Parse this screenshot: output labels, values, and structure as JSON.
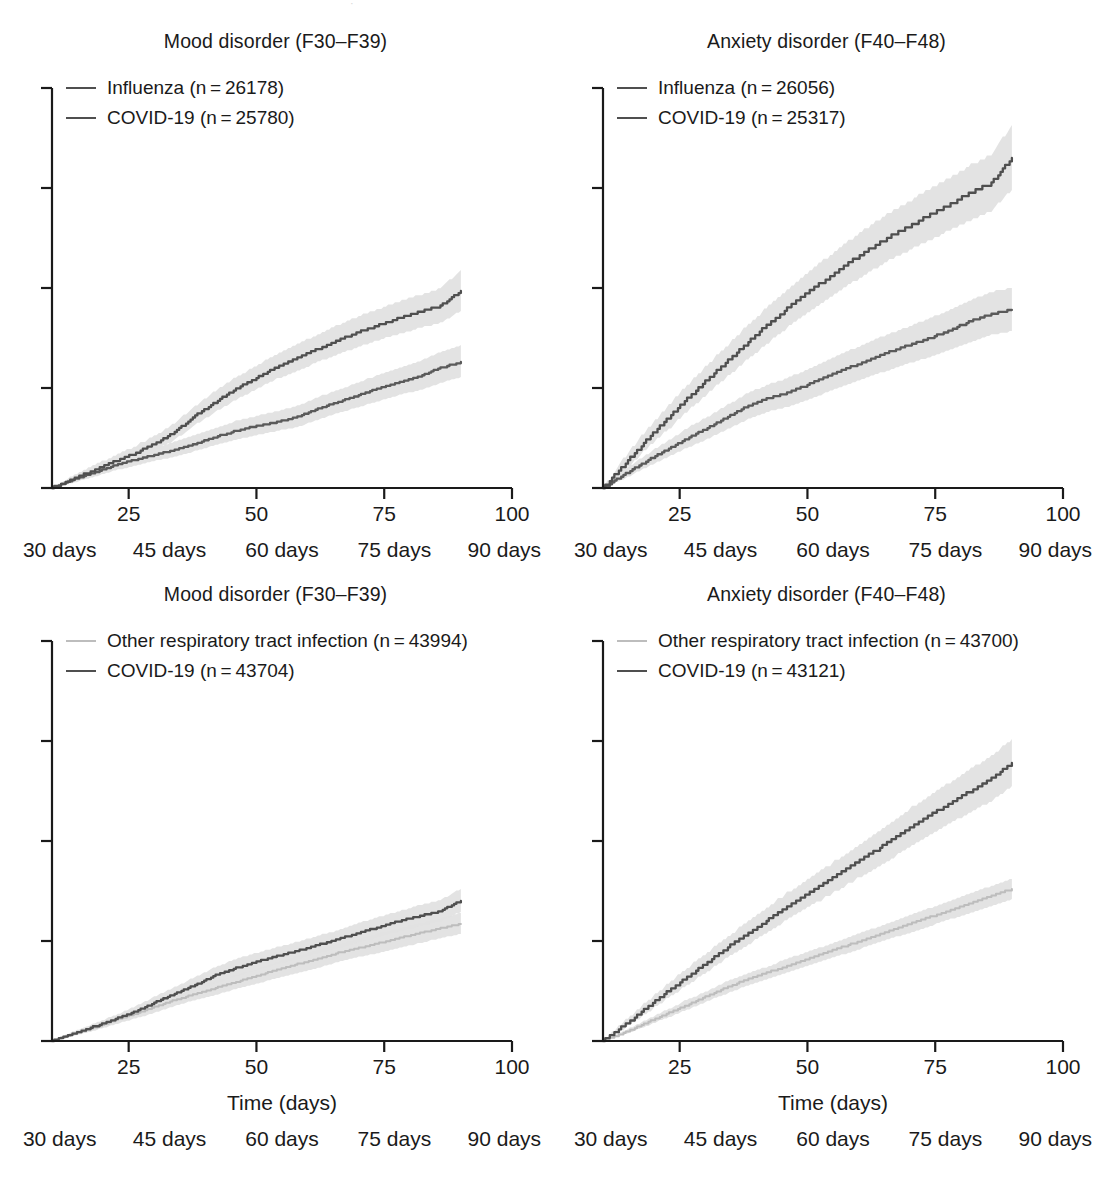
{
  "page_bleed_text": "·",
  "figure": {
    "xaxis": {
      "label": "Time (days)",
      "ticks": [
        25,
        50,
        75,
        100
      ],
      "tick_labels": [
        "25",
        "50",
        "75",
        "100"
      ],
      "range": [
        10,
        100
      ],
      "secondary_labels": [
        "30 days",
        "45 days",
        "60 days",
        "75 days",
        "90 days"
      ],
      "secondary_positions": [
        11.5,
        33.0,
        55.0,
        77.0,
        98.5
      ]
    },
    "yaxis": {
      "ticks": [
        0,
        1,
        2,
        3,
        4
      ],
      "range": [
        0,
        4
      ],
      "label": ""
    },
    "colors": {
      "covid": "#4f4f4f",
      "influenza": "#5a5a5a",
      "other_rti": "#bdbdbd",
      "ci_band": "#e2e2e2",
      "axis": "#1a1a1a"
    },
    "panels": [
      {
        "id": "mood-influenza",
        "title": "Mood disorder (F30–F39)",
        "legend": [
          {
            "label": "Influenza (n = 26178)",
            "style": "dark"
          },
          {
            "label": "COVID-19 (n = 25780)",
            "style": "dark"
          }
        ],
        "show_axis_title": false
      },
      {
        "id": "anxiety-influenza",
        "title": "Anxiety disorder (F40–F48)",
        "legend": [
          {
            "label": "Influenza (n = 26056)",
            "style": "dark"
          },
          {
            "label": "COVID-19 (n = 25317)",
            "style": "dark"
          }
        ],
        "show_axis_title": false
      },
      {
        "id": "mood-other-rti",
        "title": "Mood disorder (F30–F39)",
        "legend": [
          {
            "label": "Other respiratory tract infection (n = 43994)",
            "style": "light"
          },
          {
            "label": "COVID-19 (n = 43704)",
            "style": "dark"
          }
        ],
        "show_axis_title": true
      },
      {
        "id": "anxiety-other-rti",
        "title": "Anxiety disorder (F40–F48)",
        "legend": [
          {
            "label": "Other respiratory tract infection (n = 43700)",
            "style": "light"
          },
          {
            "label": "COVID-19 (n = 43121)",
            "style": "dark"
          }
        ],
        "show_axis_title": true
      }
    ]
  },
  "chart_data": {
    "type": "line",
    "xlabel": "Time (days)",
    "ylabel": "Estimated incidence (%)",
    "xlim": [
      10,
      100
    ],
    "ylim": [
      0,
      4
    ],
    "grid": false,
    "legend_position": "top-left",
    "x": [
      10,
      14,
      18,
      22,
      26,
      30,
      34,
      38,
      42,
      46,
      50,
      54,
      58,
      62,
      66,
      70,
      74,
      78,
      82,
      86,
      90
    ],
    "panels": [
      {
        "id": "mood-influenza",
        "title": "Mood disorder (F30–F39)",
        "ylim": [
          0,
          4
        ],
        "series": [
          {
            "name": "COVID-19 (n = 25780)",
            "color": "#4f4f4f",
            "values": [
              0.0,
              0.09,
              0.17,
              0.26,
              0.34,
              0.44,
              0.56,
              0.72,
              0.86,
              0.99,
              1.1,
              1.21,
              1.3,
              1.39,
              1.48,
              1.56,
              1.63,
              1.7,
              1.76,
              1.82,
              1.97
            ],
            "ci_low": [
              0.0,
              0.06,
              0.13,
              0.21,
              0.28,
              0.37,
              0.48,
              0.63,
              0.76,
              0.88,
              0.99,
              1.09,
              1.17,
              1.26,
              1.34,
              1.41,
              1.48,
              1.54,
              1.6,
              1.65,
              1.77
            ],
            "ci_high": [
              0.0,
              0.12,
              0.22,
              0.32,
              0.41,
              0.52,
              0.65,
              0.82,
              0.97,
              1.11,
              1.22,
              1.34,
              1.44,
              1.53,
              1.63,
              1.72,
              1.79,
              1.87,
              1.93,
              2.0,
              2.18
            ]
          },
          {
            "name": "Influenza (n = 26178)",
            "color": "#5a5a5a",
            "values": [
              0.0,
              0.08,
              0.15,
              0.22,
              0.28,
              0.33,
              0.38,
              0.44,
              0.51,
              0.57,
              0.62,
              0.66,
              0.71,
              0.79,
              0.86,
              0.93,
              1.0,
              1.06,
              1.12,
              1.2,
              1.26
            ],
            "ci_low": [
              0.0,
              0.05,
              0.11,
              0.17,
              0.22,
              0.27,
              0.31,
              0.37,
              0.43,
              0.48,
              0.53,
              0.57,
              0.61,
              0.68,
              0.75,
              0.81,
              0.87,
              0.93,
              0.98,
              1.05,
              1.11
            ],
            "ci_high": [
              0.0,
              0.11,
              0.2,
              0.28,
              0.35,
              0.4,
              0.46,
              0.53,
              0.6,
              0.67,
              0.72,
              0.77,
              0.82,
              0.91,
              0.98,
              1.06,
              1.13,
              1.2,
              1.27,
              1.36,
              1.43
            ]
          }
        ]
      },
      {
        "id": "anxiety-influenza",
        "title": "Anxiety disorder (F40–F48)",
        "ylim": [
          0,
          4
        ],
        "series": [
          {
            "name": "COVID-19 (n = 25317)",
            "color": "#4f4f4f",
            "values": [
              0.0,
              0.22,
              0.45,
              0.66,
              0.87,
              1.06,
              1.25,
              1.44,
              1.62,
              1.79,
              1.95,
              2.1,
              2.25,
              2.38,
              2.51,
              2.62,
              2.73,
              2.84,
              2.95,
              3.05,
              3.3
            ],
            "ci_low": [
              0.0,
              0.16,
              0.36,
              0.55,
              0.74,
              0.92,
              1.1,
              1.27,
              1.44,
              1.6,
              1.75,
              1.89,
              2.03,
              2.15,
              2.28,
              2.38,
              2.48,
              2.58,
              2.68,
              2.77,
              2.98
            ],
            "ci_high": [
              0.0,
              0.29,
              0.55,
              0.78,
              1.0,
              1.21,
              1.41,
              1.61,
              1.8,
              1.98,
              2.15,
              2.31,
              2.47,
              2.61,
              2.75,
              2.87,
              2.99,
              3.11,
              3.23,
              3.34,
              3.63
            ]
          },
          {
            "name": "Influenza (n = 26056)",
            "color": "#5a5a5a",
            "values": [
              0.0,
              0.13,
              0.25,
              0.37,
              0.48,
              0.59,
              0.7,
              0.81,
              0.89,
              0.95,
              1.03,
              1.12,
              1.2,
              1.28,
              1.36,
              1.43,
              1.5,
              1.58,
              1.67,
              1.74,
              1.78
            ],
            "ci_low": [
              0.0,
              0.09,
              0.19,
              0.29,
              0.39,
              0.48,
              0.58,
              0.68,
              0.76,
              0.81,
              0.88,
              0.96,
              1.04,
              1.11,
              1.18,
              1.25,
              1.31,
              1.38,
              1.46,
              1.53,
              1.57
            ],
            "ci_high": [
              0.0,
              0.18,
              0.32,
              0.45,
              0.58,
              0.7,
              0.82,
              0.94,
              1.03,
              1.1,
              1.18,
              1.28,
              1.37,
              1.46,
              1.54,
              1.62,
              1.7,
              1.78,
              1.88,
              1.96,
              2.0
            ]
          }
        ]
      },
      {
        "id": "mood-other-rti",
        "title": "Mood disorder (F30–F39)",
        "ylim": [
          0,
          4
        ],
        "series": [
          {
            "name": "COVID-19 (n = 43704)",
            "color": "#4f4f4f",
            "values": [
              0.0,
              0.07,
              0.14,
              0.21,
              0.29,
              0.38,
              0.47,
              0.56,
              0.66,
              0.73,
              0.79,
              0.85,
              0.9,
              0.96,
              1.02,
              1.08,
              1.14,
              1.2,
              1.25,
              1.3,
              1.4
            ],
            "ci_low": [
              0.0,
              0.05,
              0.11,
              0.17,
              0.24,
              0.32,
              0.41,
              0.49,
              0.58,
              0.65,
              0.71,
              0.77,
              0.82,
              0.88,
              0.93,
              0.99,
              1.04,
              1.1,
              1.15,
              1.2,
              1.29
            ],
            "ci_high": [
              0.0,
              0.09,
              0.17,
              0.25,
              0.34,
              0.44,
              0.54,
              0.64,
              0.74,
              0.82,
              0.88,
              0.94,
              0.99,
              1.05,
              1.11,
              1.18,
              1.24,
              1.3,
              1.36,
              1.41,
              1.52
            ]
          },
          {
            "name": "Other respiratory tract infection (n = 43994)",
            "color": "#bdbdbd",
            "values": [
              0.0,
              0.07,
              0.13,
              0.2,
              0.27,
              0.34,
              0.41,
              0.47,
              0.53,
              0.59,
              0.65,
              0.71,
              0.77,
              0.82,
              0.88,
              0.93,
              0.98,
              1.03,
              1.08,
              1.13,
              1.17
            ],
            "ci_low": [
              0.0,
              0.05,
              0.1,
              0.16,
              0.22,
              0.28,
              0.35,
              0.41,
              0.46,
              0.52,
              0.57,
              0.63,
              0.68,
              0.73,
              0.79,
              0.84,
              0.88,
              0.93,
              0.98,
              1.03,
              1.07
            ],
            "ci_high": [
              0.0,
              0.09,
              0.16,
              0.24,
              0.31,
              0.4,
              0.47,
              0.54,
              0.6,
              0.66,
              0.72,
              0.79,
              0.85,
              0.91,
              0.97,
              1.02,
              1.08,
              1.13,
              1.18,
              1.23,
              1.28
            ]
          }
        ]
      },
      {
        "id": "anxiety-other-rti",
        "title": "Anxiety disorder (F40–F48)",
        "ylim": [
          0,
          4
        ],
        "series": [
          {
            "name": "COVID-19 (n = 43121)",
            "color": "#4f4f4f",
            "values": [
              0.0,
              0.15,
              0.31,
              0.47,
              0.62,
              0.77,
              0.92,
              1.06,
              1.2,
              1.34,
              1.47,
              1.6,
              1.73,
              1.86,
              1.99,
              2.13,
              2.26,
              2.38,
              2.5,
              2.62,
              2.78
            ],
            "ci_low": [
              0.0,
              0.12,
              0.26,
              0.4,
              0.54,
              0.68,
              0.82,
              0.95,
              1.08,
              1.21,
              1.33,
              1.45,
              1.57,
              1.69,
              1.81,
              1.94,
              2.06,
              2.18,
              2.29,
              2.4,
              2.55
            ],
            "ci_high": [
              0.0,
              0.19,
              0.37,
              0.54,
              0.71,
              0.87,
              1.03,
              1.18,
              1.33,
              1.48,
              1.61,
              1.75,
              1.89,
              2.03,
              2.17,
              2.32,
              2.46,
              2.59,
              2.72,
              2.85,
              3.02
            ]
          },
          {
            "name": "Other respiratory tract infection (n = 43700)",
            "color": "#bdbdbd",
            "values": [
              0.0,
              0.08,
              0.17,
              0.26,
              0.35,
              0.44,
              0.53,
              0.61,
              0.68,
              0.75,
              0.82,
              0.89,
              0.96,
              1.03,
              1.1,
              1.17,
              1.24,
              1.31,
              1.38,
              1.45,
              1.52
            ],
            "ci_low": [
              0.0,
              0.06,
              0.14,
              0.22,
              0.3,
              0.39,
              0.47,
              0.55,
              0.62,
              0.68,
              0.75,
              0.82,
              0.88,
              0.95,
              1.02,
              1.08,
              1.15,
              1.22,
              1.28,
              1.35,
              1.42
            ],
            "ci_high": [
              0.0,
              0.1,
              0.2,
              0.3,
              0.4,
              0.49,
              0.59,
              0.67,
              0.74,
              0.82,
              0.89,
              0.96,
              1.04,
              1.11,
              1.18,
              1.26,
              1.33,
              1.4,
              1.48,
              1.55,
              1.62
            ]
          }
        ]
      }
    ]
  }
}
